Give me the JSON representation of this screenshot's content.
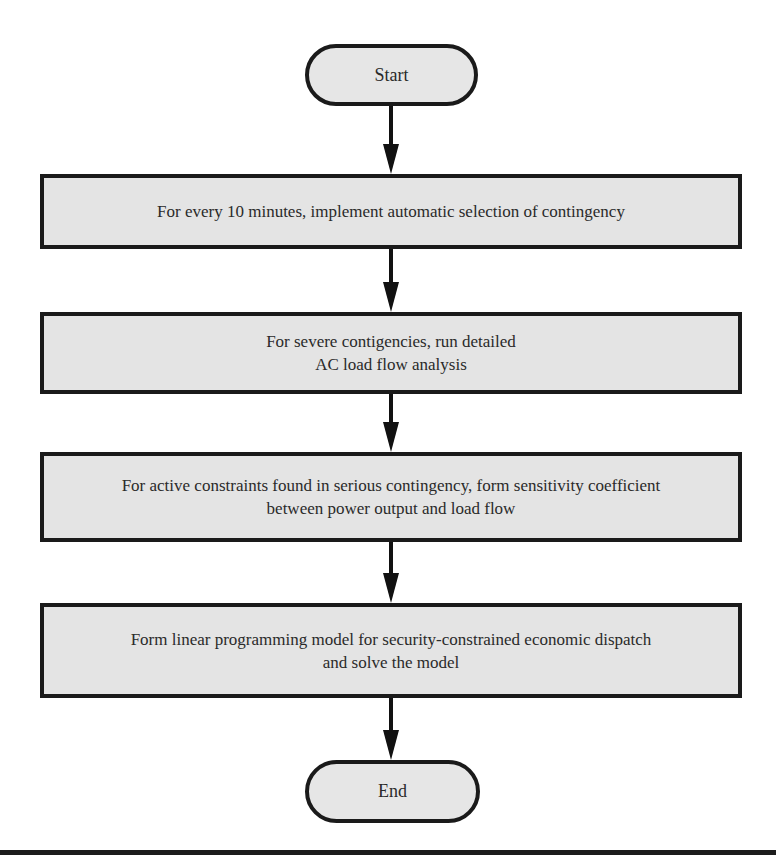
{
  "diagram": {
    "type": "flowchart",
    "start": {
      "label": "Start"
    },
    "steps": [
      {
        "lines": [
          "For every 10 minutes, implement automatic selection of contingency"
        ]
      },
      {
        "lines": [
          "For severe contigencies, run detailed",
          "AC load flow analysis"
        ]
      },
      {
        "lines": [
          "For active constraints found in serious contingency, form sensitivity coefficient",
          "between power output and load flow"
        ]
      },
      {
        "lines": [
          "Form linear programming model for security-constrained economic dispatch",
          "and solve the model"
        ]
      }
    ],
    "end": {
      "label": "End"
    },
    "colors": {
      "box_fill": "#e4e4e4",
      "stroke": "#1a1a1a",
      "background": "#ffffff"
    }
  }
}
